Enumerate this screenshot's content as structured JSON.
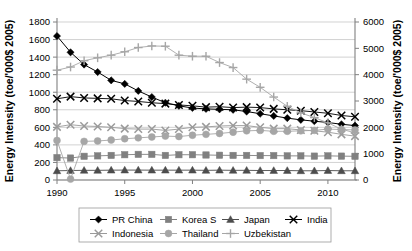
{
  "axes": {
    "left_title": "Energy Intensity (toe/'000$ 2005)",
    "right_title": "Energy Intensity (toe/'000$ 2005)",
    "left_ticks": [
      "0",
      "200",
      "400",
      "600",
      "800",
      "1000",
      "1200",
      "1400",
      "1600",
      "1800"
    ],
    "right_ticks": [
      "0",
      "1000",
      "2000",
      "3000",
      "4000",
      "5000",
      "6000"
    ],
    "x_ticks": [
      "1990",
      "1995",
      "2000",
      "2005",
      "2010"
    ]
  },
  "legend": {
    "entries": [
      {
        "label": "PR China",
        "marker": "diamond",
        "color": "#000000"
      },
      {
        "label": "Korea S",
        "marker": "square",
        "color": "#808080"
      },
      {
        "label": "Japan",
        "marker": "triangle",
        "color": "#4d4d4d"
      },
      {
        "label": "India",
        "marker": "cross-x",
        "color": "#000000"
      },
      {
        "label": "Indonesia",
        "marker": "cross-x",
        "color": "#9a9a9a"
      },
      {
        "label": "Thailand",
        "marker": "circle",
        "color": "#a6a6a6"
      },
      {
        "label": "Uzbekistan",
        "marker": "plus",
        "color": "#a6a6a6"
      }
    ]
  },
  "chart_data": {
    "type": "line",
    "title": "",
    "xlabel": "",
    "ylabel": "Energy Intensity (toe/'000$ 2005)",
    "y2label": "Energy Intensity (toe/'000$ 2005)",
    "xlim": [
      1990,
      2012
    ],
    "ylim": [
      0,
      1800
    ],
    "y2lim": [
      0,
      6000
    ],
    "grid": true,
    "legend_position": "bottom",
    "x": [
      1990,
      1991,
      1992,
      1993,
      1994,
      1995,
      1996,
      1997,
      1998,
      1999,
      2000,
      2001,
      2002,
      2003,
      2004,
      2005,
      2006,
      2007,
      2008,
      2009,
      2010,
      2011,
      2012
    ],
    "series": [
      {
        "name": "PR China",
        "axis": "left",
        "marker": "diamond",
        "color": "#000000",
        "values": [
          1640,
          1455,
          1315,
          1230,
          1135,
          1095,
          1015,
          945,
          880,
          845,
          820,
          810,
          805,
          800,
          780,
          755,
          730,
          705,
          685,
          670,
          655,
          635,
          620
        ]
      },
      {
        "name": "Korea S",
        "axis": "left",
        "marker": "square",
        "color": "#808080",
        "values": [
          255,
          250,
          270,
          275,
          280,
          288,
          292,
          292,
          280,
          288,
          288,
          285,
          282,
          280,
          280,
          278,
          278,
          275,
          275,
          272,
          275,
          272,
          270
        ]
      },
      {
        "name": "Japan",
        "axis": "left",
        "marker": "triangle",
        "color": "#4d4d4d",
        "values": [
          105,
          108,
          110,
          110,
          112,
          113,
          113,
          112,
          112,
          112,
          112,
          110,
          112,
          110,
          110,
          108,
          108,
          108,
          105,
          105,
          108,
          105,
          105
        ]
      },
      {
        "name": "India",
        "axis": "left",
        "marker": "cross-x",
        "color": "#000000",
        "values": [
          925,
          950,
          935,
          930,
          925,
          905,
          895,
          880,
          870,
          855,
          845,
          830,
          835,
          825,
          830,
          825,
          810,
          800,
          790,
          775,
          760,
          735,
          720
        ]
      },
      {
        "name": "Indonesia",
        "axis": "left",
        "marker": "cross-x",
        "color": "#9a9a9a",
        "values": [
          605,
          630,
          615,
          610,
          600,
          585,
          580,
          580,
          565,
          580,
          600,
          605,
          615,
          620,
          620,
          600,
          585,
          585,
          570,
          560,
          545,
          520,
          500
        ]
      },
      {
        "name": "Thailand",
        "axis": "left",
        "marker": "circle",
        "color": "#a6a6a6",
        "values": [
          450,
          10,
          440,
          445,
          455,
          470,
          480,
          490,
          500,
          495,
          510,
          520,
          530,
          545,
          560,
          565,
          555,
          555,
          560,
          565,
          580,
          575,
          570
        ]
      },
      {
        "name": "Uzbekistan",
        "axis": "right",
        "marker": "plus",
        "color": "#a6a6a6",
        "values": [
          4170,
          4290,
          4530,
          4640,
          4740,
          4870,
          5030,
          5090,
          5080,
          4740,
          4700,
          4700,
          4460,
          4270,
          3830,
          3520,
          3150,
          2800,
          2550,
          2370,
          2170,
          1930,
          1790
        ]
      }
    ]
  }
}
